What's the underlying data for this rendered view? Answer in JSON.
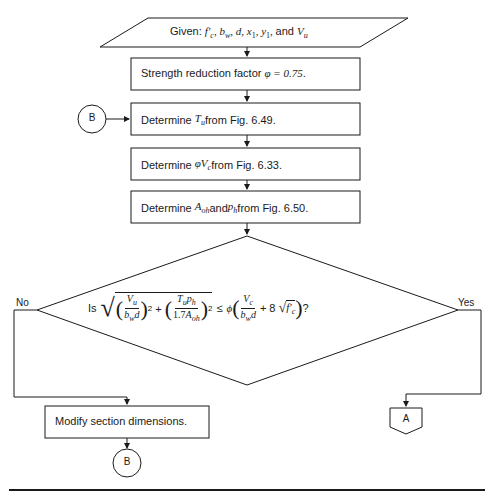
{
  "diagram": {
    "type": "flowchart",
    "input": {
      "prefix": "Given: ",
      "vars": [
        "f'c",
        "bw",
        "d",
        "x1",
        "y1",
        "Vu"
      ],
      "text": "Given: f'c, bw, d, x1, y1, and Vu"
    },
    "steps": [
      {
        "id": "step1",
        "text": "Strength reduction factor φ = 0.75.",
        "prefix": "Strength reduction factor ",
        "math": "φ = 0.75",
        "suffix": "."
      },
      {
        "id": "step2",
        "prefix": "Determine ",
        "math": "T",
        "math_sub": "u",
        "suffix": " from Fig. 6.49.",
        "text": "Determine Tu from Fig. 6.49."
      },
      {
        "id": "step3",
        "prefix": "Determine ",
        "math": "φV",
        "math_sub": "c",
        "suffix": " from Fig. 6.33.",
        "text": "Determine φVc from Fig. 6.33."
      },
      {
        "id": "step4",
        "prefix": "Determine ",
        "math1": "A",
        "math1_sub": "oh",
        "mid": " and ",
        "math2": "p",
        "math2_sub": "h",
        "suffix": " from Fig. 6.50.",
        "text": "Determine Aoh and ph from Fig. 6.50."
      }
    ],
    "decision": {
      "text": "Is √((Vu/(bw d))² + ((Tu ph)/(1.7 Aoh²))²) ≤ φ(Vc/(bw d) + 8√f'c)?",
      "prefix": "Is",
      "suffix": "?",
      "no_label": "No",
      "yes_label": "Yes"
    },
    "modify": {
      "text": "Modify section dimensions."
    },
    "connectors": {
      "entry": "B",
      "loop_back": "B",
      "offpage": "A"
    }
  }
}
